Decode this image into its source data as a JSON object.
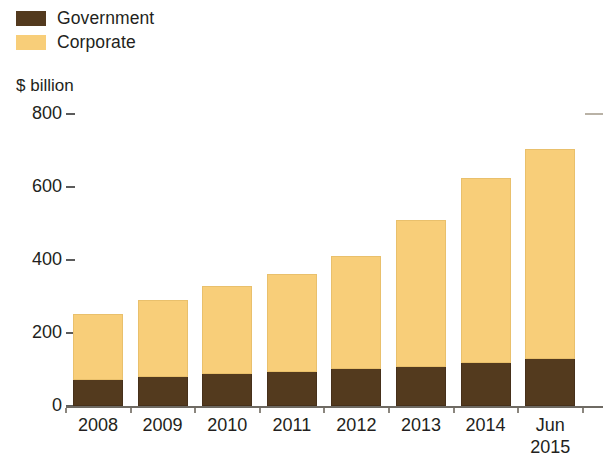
{
  "chart_data": {
    "type": "bar",
    "subtype": "stacked-vertical",
    "title": "",
    "subtitle": "",
    "xlabel": "",
    "ylabel": "$ billion",
    "ylim": [
      0,
      800
    ],
    "yticks": [
      0,
      200,
      400,
      600,
      800
    ],
    "ytick_labels": [
      "0",
      "200",
      "400",
      "600",
      "800"
    ],
    "grid": false,
    "legend_position": "top-left",
    "categories": [
      "2008",
      "2009",
      "2010",
      "2011",
      "2012",
      "2013",
      "2014",
      "Jun\n2015"
    ],
    "series": [
      {
        "name": "Government",
        "color": "#533a1e",
        "values": [
          71,
          79,
          88,
          93,
          101,
          107,
          118,
          129
        ]
      },
      {
        "name": "Corporate",
        "color": "#f8ce79",
        "values": [
          181,
          211,
          241,
          269,
          310,
          403,
          507,
          574
        ]
      }
    ],
    "totals": [
      252,
      290,
      329,
      362,
      411,
      510,
      625,
      703
    ],
    "stack_order": [
      "Government",
      "Corporate"
    ]
  },
  "legend": {
    "items": [
      {
        "label": "Government",
        "color": "#533a1e"
      },
      {
        "label": "Corporate",
        "color": "#f8ce79"
      }
    ]
  },
  "axes": {
    "y_unit_label": "$ billion",
    "y_ticks": [
      "800",
      "600",
      "400",
      "200",
      "0"
    ],
    "x_labels": [
      "2008",
      "2009",
      "2010",
      "2011",
      "2012",
      "2013",
      "2014",
      "Jun\n2015"
    ]
  },
  "colors": {
    "government": "#533a1e",
    "corporate": "#f8ce79",
    "axis": "#6e6a63",
    "text": "#231f20",
    "background": "#ffffff"
  }
}
